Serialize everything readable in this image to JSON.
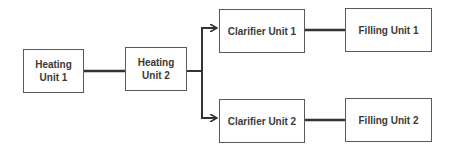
{
  "diagram": {
    "type": "flowchart",
    "nodes": [
      {
        "id": "heating1",
        "label": "Heating Unit 1",
        "line1": "Heating",
        "line2": "Unit 1"
      },
      {
        "id": "heating2",
        "label": "Heating Unit 2",
        "line1": "Heating",
        "line2": "Unit 2"
      },
      {
        "id": "clarifier1",
        "label": "Clarifier Unit 1"
      },
      {
        "id": "clarifier2",
        "label": "Clarifier Unit 2"
      },
      {
        "id": "filling1",
        "label": "Filling Unit 1"
      },
      {
        "id": "filling2",
        "label": "Filling Unit 2"
      }
    ],
    "edges": [
      {
        "from": "heating1",
        "to": "heating2"
      },
      {
        "from": "heating2",
        "to": "clarifier1"
      },
      {
        "from": "heating2",
        "to": "clarifier2"
      },
      {
        "from": "clarifier1",
        "to": "filling1"
      },
      {
        "from": "clarifier2",
        "to": "filling2"
      }
    ],
    "colors": {
      "line": "#333333",
      "border": "#5a5a5a",
      "text": "#3a3a3a",
      "background": "#ffffff"
    }
  }
}
